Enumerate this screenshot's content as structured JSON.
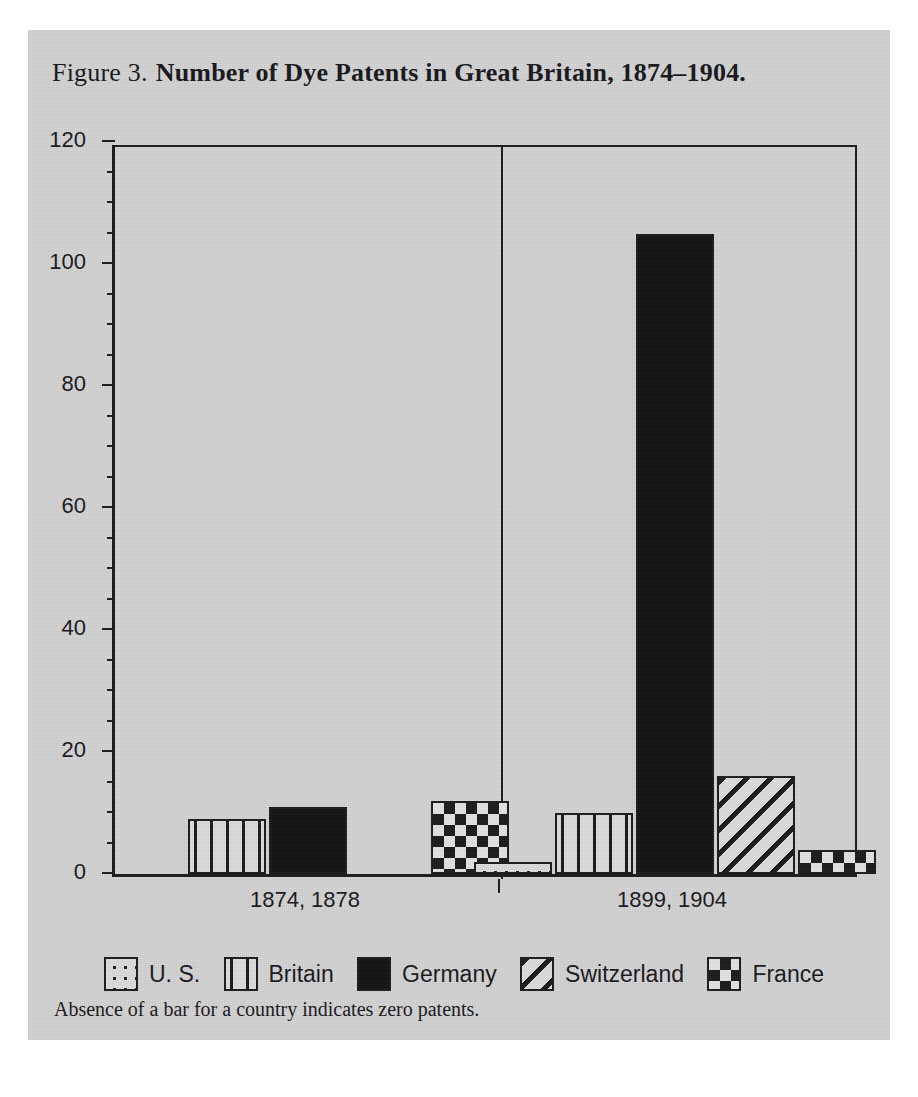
{
  "figure": {
    "label": "Figure 3.",
    "title": "Number of Dye Patents in Great Britain, 1874–1904.",
    "footnote": "Absence of a bar for a country indicates zero patents."
  },
  "axis": {
    "y_ticks": [
      "0",
      "20",
      "40",
      "60",
      "80",
      "100",
      "120"
    ],
    "x_categories": [
      "1874, 1878",
      "1899, 1904"
    ]
  },
  "legend": {
    "items": [
      {
        "label": "U. S.",
        "pattern": "dots"
      },
      {
        "label": "Britain",
        "pattern": "vertical-lines"
      },
      {
        "label": "Germany",
        "pattern": "solid-black"
      },
      {
        "label": "Switzerland",
        "pattern": "diagonal-hatch"
      },
      {
        "label": "France",
        "pattern": "checkerboard"
      }
    ]
  },
  "colors": {
    "plate_background": "#d3d3d3",
    "ink": "#1a1a1a",
    "fill_light": "#dcdcdc"
  },
  "chart_data": {
    "type": "bar",
    "title": "Number of Dye Patents in Great Britain, 1874–1904.",
    "xlabel": "",
    "ylabel": "",
    "ylim": [
      0,
      120
    ],
    "ytick_interval": 20,
    "yminor_tick_interval": 5,
    "grid": false,
    "legend_position": "bottom",
    "note": "Absence of a bar for a country indicates zero patents.",
    "categories": [
      "1874, 1878",
      "1899, 1904"
    ],
    "series": [
      {
        "name": "U. S.",
        "pattern": "dots",
        "values": [
          0,
          2
        ]
      },
      {
        "name": "Britain",
        "pattern": "vertical-lines",
        "values": [
          9,
          10
        ]
      },
      {
        "name": "Germany",
        "pattern": "solid-black",
        "values": [
          11,
          105
        ]
      },
      {
        "name": "Switzerland",
        "pattern": "diagonal-hatch",
        "values": [
          0,
          16
        ]
      },
      {
        "name": "France",
        "pattern": "checkerboard",
        "values": [
          12,
          4
        ]
      }
    ]
  }
}
